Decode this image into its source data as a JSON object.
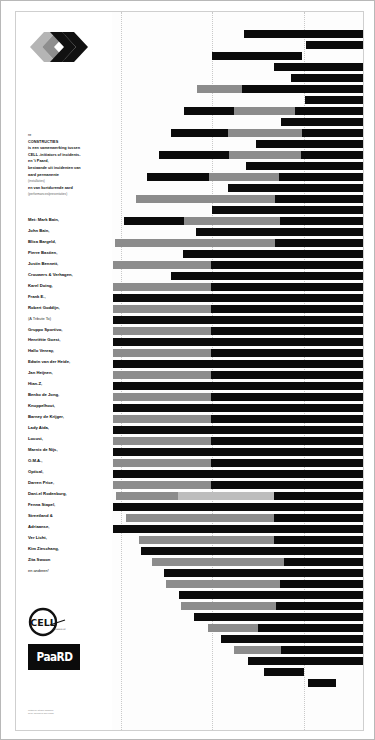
{
  "poster": {
    "logo_icon": "chevron-logo",
    "intro": {
      "line0": "re",
      "title": "CONSTRUCTIES",
      "body1": "is een samenwerking tussen",
      "body2": "CELL -initiators of incidents-",
      "body3": "en 't Paard,",
      "body4": "bestaande uit incidenten van",
      "body5": "aard permanente",
      "body5_note": "(installaties)",
      "body6": "en van kortdurende aard",
      "body6_note": "(performances/presentaties)"
    },
    "names_heading": "Met: Mark Bain,",
    "names": [
      "John Bain,",
      "Blixa Bargeld,",
      "Pierre Bastien,",
      "Justin Bennett,",
      "Crouwers & Verhagen,",
      "Karel Doing,",
      "Frank E.,",
      "Robert Goddijn,",
      "(A Tribute To)",
      "Gruppo Sportivo,",
      "Henriëtte Goest,",
      "Hallo Venray,",
      "Edwin van der Heide,",
      "Jan Heijnen,",
      "Hian-Z,",
      "Benko de Jong,",
      "Knuppelhout,",
      "Barney de Krijger,",
      "Lady Aida,",
      "Locust,",
      "Marnix de Nijs,",
      "O.M.A.,",
      "Optical,",
      "Darren Price,",
      "Dani-el Rodenburg,",
      "Fenna Stapel,",
      "Streetland &",
      "Adriaanse,",
      "Ver Licht,",
      "Kim Zieschang,",
      "Zita Swoon"
    ],
    "names_footer": "en anderen!",
    "cell_logo_text": "CELL",
    "cell_logo_sub": "initiators of incidents",
    "paard_logo_text": "PaaRD",
    "credits_line1": "ontwerp: studio grafisch",
    "credits_line2": "druk: drukkerij den haag"
  },
  "colors": {
    "dark": "#0b0b0b",
    "gray": "#8c8c8c",
    "light": "#bdbdbd",
    "paper": "#ffffff",
    "gridline": "#c9c9c9"
  },
  "chart_data": {
    "type": "bar",
    "orientation": "horizontal",
    "xlabel": "",
    "ylabel": "",
    "grid": true,
    "gridlines_x": [
      105,
      196,
      288
    ],
    "xlim": [
      96,
      347
    ],
    "legend": [],
    "bars": [
      {
        "y": 18,
        "start": 228,
        "segments": [
          {
            "w": 119,
            "c": "dark"
          }
        ]
      },
      {
        "y": 29,
        "start": 290,
        "segments": [
          {
            "w": 57,
            "c": "dark"
          }
        ]
      },
      {
        "y": 40,
        "start": 196,
        "segments": [
          {
            "w": 90,
            "c": "dark"
          }
        ]
      },
      {
        "y": 51,
        "start": 258,
        "segments": [
          {
            "w": 30,
            "c": "dark"
          },
          {
            "w": 59,
            "c": "dark"
          }
        ]
      },
      {
        "y": 62,
        "start": 275,
        "segments": [
          {
            "w": 72,
            "c": "dark"
          }
        ]
      },
      {
        "y": 73,
        "start": 181,
        "segments": [
          {
            "w": 45,
            "c": "gray"
          },
          {
            "w": 60,
            "c": "dark"
          },
          {
            "w": 61,
            "c": "dark"
          }
        ]
      },
      {
        "y": 84,
        "start": 289,
        "segments": [
          {
            "w": 58,
            "c": "dark"
          }
        ]
      },
      {
        "y": 95,
        "start": 168,
        "segments": [
          {
            "w": 50,
            "c": "dark"
          },
          {
            "w": 61,
            "c": "gray"
          },
          {
            "w": 68,
            "c": "dark"
          }
        ]
      },
      {
        "y": 106,
        "start": 265,
        "segments": [
          {
            "w": 82,
            "c": "dark"
          }
        ]
      },
      {
        "y": 117,
        "start": 155,
        "segments": [
          {
            "w": 57,
            "c": "dark"
          },
          {
            "w": 74,
            "c": "gray"
          },
          {
            "w": 61,
            "c": "dark"
          }
        ]
      },
      {
        "y": 128,
        "start": 240,
        "segments": [
          {
            "w": 107,
            "c": "dark"
          }
        ]
      },
      {
        "y": 139,
        "start": 143,
        "segments": [
          {
            "w": 70,
            "c": "dark"
          },
          {
            "w": 72,
            "c": "gray"
          },
          {
            "w": 62,
            "c": "dark"
          }
        ]
      },
      {
        "y": 150,
        "start": 230,
        "segments": [
          {
            "w": 117,
            "c": "dark"
          }
        ]
      },
      {
        "y": 161,
        "start": 131,
        "segments": [
          {
            "w": 62,
            "c": "dark"
          },
          {
            "w": 70,
            "c": "gray"
          },
          {
            "w": 84,
            "c": "dark"
          }
        ]
      },
      {
        "y": 172,
        "start": 212,
        "segments": [
          {
            "w": 135,
            "c": "dark"
          }
        ]
      },
      {
        "y": 183,
        "start": 120,
        "segments": [
          {
            "w": 62,
            "c": "gray"
          },
          {
            "w": 77,
            "c": "gray"
          },
          {
            "w": 88,
            "c": "dark"
          }
        ]
      },
      {
        "y": 194,
        "start": 196,
        "segments": [
          {
            "w": 151,
            "c": "dark"
          }
        ]
      },
      {
        "y": 205,
        "start": 108,
        "segments": [
          {
            "w": 60,
            "c": "dark"
          },
          {
            "w": 96,
            "c": "gray"
          },
          {
            "w": 83,
            "c": "dark"
          }
        ]
      },
      {
        "y": 216,
        "start": 180,
        "segments": [
          {
            "w": 167,
            "c": "dark"
          }
        ]
      },
      {
        "y": 227,
        "start": 99,
        "segments": [
          {
            "w": 50,
            "c": "gray"
          },
          {
            "w": 110,
            "c": "gray"
          },
          {
            "w": 88,
            "c": "dark"
          }
        ]
      },
      {
        "y": 238,
        "start": 167,
        "segments": [
          {
            "w": 180,
            "c": "dark"
          }
        ]
      },
      {
        "y": 249,
        "start": 97,
        "segments": [
          {
            "w": 98,
            "c": "gray"
          },
          {
            "w": 152,
            "c": "dark"
          }
        ]
      },
      {
        "y": 260,
        "start": 155,
        "segments": [
          {
            "w": 192,
            "c": "dark"
          }
        ]
      },
      {
        "y": 271,
        "start": 97,
        "segments": [
          {
            "w": 98,
            "c": "gray"
          },
          {
            "w": 152,
            "c": "dark"
          }
        ]
      },
      {
        "y": 282,
        "start": 97,
        "segments": [
          {
            "w": 98,
            "c": "dark"
          },
          {
            "w": 152,
            "c": "dark"
          }
        ]
      },
      {
        "y": 293,
        "start": 97,
        "segments": [
          {
            "w": 98,
            "c": "gray"
          },
          {
            "w": 152,
            "c": "dark"
          }
        ]
      },
      {
        "y": 304,
        "start": 97,
        "segments": [
          {
            "w": 98,
            "c": "dark"
          },
          {
            "w": 152,
            "c": "dark"
          }
        ]
      },
      {
        "y": 315,
        "start": 97,
        "segments": [
          {
            "w": 98,
            "c": "gray"
          },
          {
            "w": 152,
            "c": "dark"
          }
        ]
      },
      {
        "y": 326,
        "start": 97,
        "segments": [
          {
            "w": 98,
            "c": "dark"
          },
          {
            "w": 152,
            "c": "dark"
          }
        ]
      },
      {
        "y": 337,
        "start": 97,
        "segments": [
          {
            "w": 98,
            "c": "gray"
          },
          {
            "w": 152,
            "c": "dark"
          }
        ]
      },
      {
        "y": 348,
        "start": 97,
        "segments": [
          {
            "w": 98,
            "c": "dark"
          },
          {
            "w": 152,
            "c": "dark"
          }
        ]
      },
      {
        "y": 359,
        "start": 97,
        "segments": [
          {
            "w": 98,
            "c": "gray"
          },
          {
            "w": 152,
            "c": "dark"
          }
        ]
      },
      {
        "y": 370,
        "start": 97,
        "segments": [
          {
            "w": 98,
            "c": "dark"
          },
          {
            "w": 152,
            "c": "dark"
          }
        ]
      },
      {
        "y": 381,
        "start": 97,
        "segments": [
          {
            "w": 98,
            "c": "gray"
          },
          {
            "w": 152,
            "c": "dark"
          }
        ]
      },
      {
        "y": 392,
        "start": 97,
        "segments": [
          {
            "w": 98,
            "c": "dark"
          },
          {
            "w": 152,
            "c": "dark"
          }
        ]
      },
      {
        "y": 403,
        "start": 97,
        "segments": [
          {
            "w": 98,
            "c": "gray"
          },
          {
            "w": 152,
            "c": "dark"
          }
        ]
      },
      {
        "y": 414,
        "start": 97,
        "segments": [
          {
            "w": 98,
            "c": "dark"
          },
          {
            "w": 152,
            "c": "dark"
          }
        ]
      },
      {
        "y": 425,
        "start": 97,
        "segments": [
          {
            "w": 98,
            "c": "gray"
          },
          {
            "w": 152,
            "c": "dark"
          }
        ]
      },
      {
        "y": 436,
        "start": 97,
        "segments": [
          {
            "w": 98,
            "c": "dark"
          },
          {
            "w": 152,
            "c": "dark"
          }
        ]
      },
      {
        "y": 447,
        "start": 97,
        "segments": [
          {
            "w": 98,
            "c": "gray"
          },
          {
            "w": 152,
            "c": "dark"
          }
        ]
      },
      {
        "y": 458,
        "start": 97,
        "segments": [
          {
            "w": 98,
            "c": "dark"
          },
          {
            "w": 152,
            "c": "dark"
          }
        ]
      },
      {
        "y": 469,
        "start": 97,
        "segments": [
          {
            "w": 98,
            "c": "gray"
          },
          {
            "w": 152,
            "c": "dark"
          }
        ]
      },
      {
        "y": 480,
        "start": 100,
        "segments": [
          {
            "w": 62,
            "c": "gray"
          },
          {
            "w": 96,
            "c": "light"
          },
          {
            "w": 89,
            "c": "dark"
          }
        ]
      },
      {
        "y": 491,
        "start": 97,
        "segments": [
          {
            "w": 98,
            "c": "dark"
          },
          {
            "w": 152,
            "c": "dark"
          }
        ]
      },
      {
        "y": 502,
        "start": 110,
        "segments": [
          {
            "w": 58,
            "c": "gray"
          },
          {
            "w": 90,
            "c": "gray"
          },
          {
            "w": 89,
            "c": "dark"
          }
        ]
      },
      {
        "y": 513,
        "start": 97,
        "segments": [
          {
            "w": 98,
            "c": "dark"
          },
          {
            "w": 152,
            "c": "dark"
          }
        ]
      },
      {
        "y": 524,
        "start": 123,
        "segments": [
          {
            "w": 55,
            "c": "gray"
          },
          {
            "w": 80,
            "c": "gray"
          },
          {
            "w": 89,
            "c": "dark"
          }
        ]
      },
      {
        "y": 535,
        "start": 125,
        "segments": [
          {
            "w": 222,
            "c": "dark"
          }
        ]
      },
      {
        "y": 546,
        "start": 136,
        "segments": [
          {
            "w": 60,
            "c": "gray"
          },
          {
            "w": 72,
            "c": "gray"
          },
          {
            "w": 79,
            "c": "dark"
          }
        ]
      },
      {
        "y": 557,
        "start": 148,
        "segments": [
          {
            "w": 199,
            "c": "dark"
          }
        ]
      },
      {
        "y": 568,
        "start": 150,
        "segments": [
          {
            "w": 46,
            "c": "gray"
          },
          {
            "w": 68,
            "c": "gray"
          },
          {
            "w": 83,
            "c": "dark"
          }
        ]
      },
      {
        "y": 579,
        "start": 163,
        "segments": [
          {
            "w": 184,
            "c": "dark"
          }
        ]
      },
      {
        "y": 590,
        "start": 165,
        "segments": [
          {
            "w": 31,
            "c": "gray"
          },
          {
            "w": 64,
            "c": "gray"
          },
          {
            "w": 87,
            "c": "dark"
          }
        ]
      },
      {
        "y": 601,
        "start": 178,
        "segments": [
          {
            "w": 169,
            "c": "dark"
          }
        ]
      },
      {
        "y": 612,
        "start": 192,
        "segments": [
          {
            "w": 50,
            "c": "gray"
          },
          {
            "w": 105,
            "c": "dark"
          }
        ]
      },
      {
        "y": 623,
        "start": 205,
        "segments": [
          {
            "w": 142,
            "c": "dark"
          }
        ]
      },
      {
        "y": 634,
        "start": 218,
        "segments": [
          {
            "w": 47,
            "c": "gray"
          },
          {
            "w": 82,
            "c": "dark"
          }
        ]
      },
      {
        "y": 645,
        "start": 232,
        "segments": [
          {
            "w": 115,
            "c": "dark"
          }
        ]
      },
      {
        "y": 656,
        "start": 248,
        "segments": [
          {
            "w": 40,
            "c": "dark"
          }
        ]
      },
      {
        "y": 667,
        "start": 292,
        "segments": [
          {
            "w": 28,
            "c": "dark"
          }
        ]
      }
    ]
  }
}
